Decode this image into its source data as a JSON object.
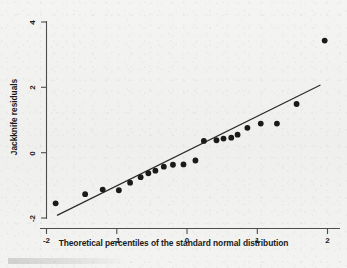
{
  "chart_data": {
    "type": "scatter",
    "title": "",
    "subtitle": "",
    "xlabel": "Theoretical percentiles of the standard normal distribution",
    "ylabel": "Jackknife residuals",
    "xlim": [
      -2.18,
      2.05
    ],
    "ylim": [
      -2.15,
      4.1
    ],
    "xticks": [
      -2,
      -1,
      0,
      1,
      2
    ],
    "xtick_labels": [
      "-2",
      "-1",
      "0",
      "1",
      "2"
    ],
    "yticks": [
      -2,
      0,
      2,
      4
    ],
    "ytick_labels": [
      "-2",
      "0",
      "2",
      "4"
    ],
    "grid": false,
    "legend": null,
    "legend_position": "none",
    "marker_color": "#1a1a1a",
    "line_color": "#2b2b2b",
    "axis_color": "#555555",
    "background_color": "#f2f2f0",
    "series": [
      {
        "name": "Jackknife residuals",
        "type": "scatter",
        "x": [
          -1.87,
          -1.45,
          -1.2,
          -0.97,
          -0.81,
          -0.66,
          -0.55,
          -0.45,
          -0.33,
          -0.2,
          -0.05,
          0.12,
          0.24,
          0.42,
          0.52,
          0.63,
          0.72,
          0.86,
          1.05,
          1.28,
          1.56,
          1.96
        ],
        "y": [
          -1.55,
          -1.27,
          -1.13,
          -1.15,
          -0.92,
          -0.75,
          -0.63,
          -0.55,
          -0.43,
          -0.37,
          -0.36,
          -0.24,
          0.36,
          0.38,
          0.43,
          0.46,
          0.55,
          0.76,
          0.89,
          0.89,
          1.49,
          3.43
        ]
      },
      {
        "name": "Reference line",
        "type": "line",
        "x": [
          -1.85,
          1.9
        ],
        "y": [
          -1.92,
          2.07
        ]
      }
    ],
    "annotations": [
      {
        "text": "outlier at upper right",
        "x": 1.96,
        "y": 3.43
      }
    ]
  },
  "figure": {
    "xlabel": "Theoretical percentiles of the standard normal distribution",
    "ylabel": "Jackknife residuals",
    "xtick_labels": [
      "-2",
      "-1",
      "0",
      "1",
      "2"
    ],
    "ytick_labels": [
      "-2",
      "0",
      "2",
      "4"
    ]
  }
}
